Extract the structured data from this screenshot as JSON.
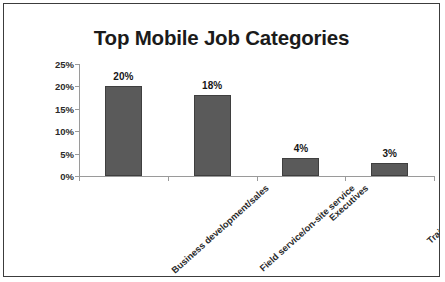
{
  "chart_data": {
    "type": "bar",
    "title": "Top Mobile Job Categories",
    "xlabel": "",
    "ylabel": "",
    "categories": [
      "Business development/sales",
      "Field service/on-site service",
      "Executives",
      "Training/education"
    ],
    "values": [
      20,
      18,
      4,
      3
    ],
    "value_labels": [
      "20%",
      "18%",
      "4%",
      "3%"
    ],
    "ylim": [
      0,
      25
    ],
    "ytick_labels": [
      "25%",
      "20%",
      "15%",
      "10%",
      "5%",
      "0%"
    ],
    "ytick_values": [
      25,
      20,
      15,
      10,
      5,
      0
    ],
    "grid": false,
    "legend": false,
    "bar_color": "#5a5a5a",
    "bar_border_color": "#3f3f3f",
    "axis_color": "#9a9a9a",
    "text_color": "#1b1b1b",
    "frame_color": "#3c3c3c",
    "background": "#ffffff"
  }
}
